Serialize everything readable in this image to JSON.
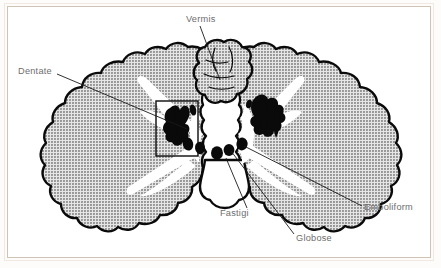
{
  "figure": {
    "type": "anatomical-diagram",
    "colors": {
      "page_background": "#ffffff",
      "page_border": "#cfc3b4",
      "cortex_fill": "#b3b3b3",
      "white_matter": "#ffffff",
      "outline": "#0a0a0a",
      "nuclei": "#0a0a0a",
      "label_text": "#6e6e6e",
      "leader_line": "#1a1a1a"
    },
    "labels": [
      {
        "id": "vermis",
        "text": "Vermis",
        "x": 186,
        "y": 22,
        "anchor": "start"
      },
      {
        "id": "dentate",
        "text": "Dentate",
        "x": 18,
        "y": 74,
        "anchor": "start"
      },
      {
        "id": "fastigi",
        "text": "Fastigi",
        "x": 220,
        "y": 216,
        "anchor": "start"
      },
      {
        "id": "globose",
        "text": "Globose",
        "x": 296,
        "y": 241,
        "anchor": "start"
      },
      {
        "id": "emboliform",
        "text": "Emboliform",
        "x": 364,
        "y": 210,
        "anchor": "start"
      }
    ],
    "callout_box": {
      "x": 156,
      "y": 101,
      "width": 42,
      "height": 55
    },
    "structures": [
      "cerebellar cortex",
      "arbor vitae (white matter)",
      "vermis",
      "dentate nucleus",
      "emboliform nucleus",
      "globose nucleus",
      "fastigial nucleus"
    ]
  }
}
